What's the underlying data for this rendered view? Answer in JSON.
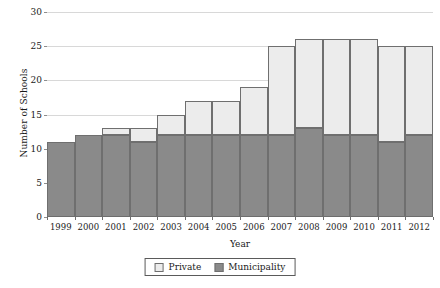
{
  "chart_data": {
    "type": "bar",
    "stacked": true,
    "title": "",
    "xlabel": "Year",
    "ylabel": "Number of Schools",
    "ylim": [
      0,
      30
    ],
    "ytick_step": 5,
    "yticks": [
      0,
      5,
      10,
      15,
      20,
      25,
      30
    ],
    "grid": true,
    "legend_position": "bottom",
    "categories": [
      "1999",
      "2000",
      "2001",
      "2002",
      "2003",
      "2004",
      "2005",
      "2006",
      "2007",
      "2008",
      "2009",
      "2010",
      "2011",
      "2012"
    ],
    "series": [
      {
        "name": "Municipality",
        "color": "#8a8a8a",
        "values": [
          11,
          12,
          12,
          11,
          12,
          12,
          12,
          12,
          12,
          13,
          12,
          12,
          11,
          12
        ]
      },
      {
        "name": "Private",
        "color": "#ececec",
        "values": [
          0,
          0,
          1,
          2,
          3,
          5,
          5,
          7,
          13,
          13,
          14,
          14,
          14,
          13
        ]
      }
    ],
    "totals": [
      11,
      12,
      13,
      13,
      15,
      17,
      17,
      19,
      25,
      26,
      26,
      26,
      25,
      25
    ]
  },
  "legend": {
    "items": [
      {
        "label": "Private",
        "color": "#ececec"
      },
      {
        "label": "Municipality",
        "color": "#8a8a8a"
      }
    ]
  },
  "colors": {
    "municipality": "#8a8a8a",
    "private": "#ececec",
    "grid": "#d8d8d8",
    "axis": "#6d6d6d",
    "bar_border": "#6f6f6f"
  }
}
